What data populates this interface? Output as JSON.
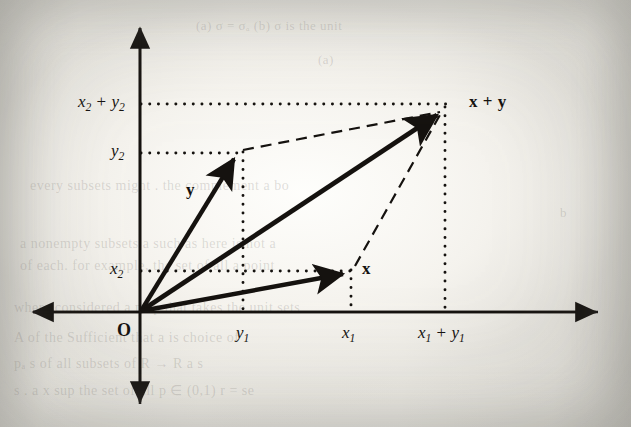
{
  "figure": {
    "kind": "vector-addition-parallelogram-diagram",
    "origin_label": "O",
    "axis_labels": {
      "y_top_value": "x₂ + y₂",
      "y_mid_value": "y₂",
      "y_low_value": "x₂",
      "x_first_value": "y₁",
      "x_second_value": "x₁",
      "x_sum_value": "x₁ + y₁"
    },
    "vector_labels": {
      "vec_y": "y",
      "vec_x": "x",
      "vec_sum": "x + y"
    },
    "parts": {
      "x2_plus_y2": {
        "base": "x",
        "sub": "2",
        "op": " + ",
        "base2": "y",
        "sub2": "2"
      },
      "y2": {
        "base": "y",
        "sub": "2"
      },
      "x2": {
        "base": "x",
        "sub": "2"
      },
      "y1": {
        "base": "y",
        "sub": "1"
      },
      "x1": {
        "base": "x",
        "sub": "1"
      },
      "x1_plus_y1": {
        "base": "x",
        "sub": "1",
        "op": " + ",
        "base2": "y",
        "sub2": "1"
      },
      "sum_vec": {
        "first": "x",
        "op": " + ",
        "second": "y"
      }
    },
    "colors": {
      "ink": "#15120f",
      "paper": "#efedE7",
      "bleed_text": "rgba(92,88,82,0.20)"
    }
  },
  "chart_data": {
    "type": "scatter",
    "title": "",
    "xlabel": "",
    "ylabel": "",
    "grid": false,
    "legend": "none",
    "axis_style": "double-headed arrows, no tick marks, labelled component values only",
    "points": [
      {
        "name": "O",
        "label": "O",
        "px": [
          140,
          312
        ],
        "role": "origin"
      },
      {
        "name": "y-tip",
        "label": "y",
        "px": [
          238,
          152
        ],
        "components": [
          "y₁",
          "y₂"
        ]
      },
      {
        "name": "x-tip",
        "label": "x",
        "px": [
          350,
          270
        ],
        "components": [
          "x₁",
          "x₂"
        ]
      },
      {
        "name": "sum-tip",
        "label": "x + y",
        "px": [
          443,
          108
        ],
        "components": [
          "x₁ + y₁",
          "x₂ + y₂"
        ]
      }
    ],
    "vectors": [
      {
        "name": "y",
        "from": "O",
        "to": "y-tip",
        "style": "solid-arrow"
      },
      {
        "name": "x",
        "from": "O",
        "to": "x-tip",
        "style": "solid-arrow"
      },
      {
        "name": "x + y",
        "from": "O",
        "to": "sum-tip",
        "style": "solid-arrow"
      }
    ],
    "dashed_edges": [
      {
        "from": "y-tip",
        "to": "sum-tip"
      },
      {
        "from": "x-tip",
        "to": "sum-tip"
      }
    ],
    "dotted_guides": [
      {
        "orientation": "horizontal",
        "value_label": "x₂ + y₂",
        "y_px": 104,
        "from_x": 141,
        "to_x": 446
      },
      {
        "orientation": "horizontal",
        "value_label": "y₂",
        "y_px": 153,
        "from_x": 141,
        "to_x": 243
      },
      {
        "orientation": "horizontal",
        "value_label": "x₂",
        "y_px": 271,
        "from_x": 141,
        "to_x": 352
      },
      {
        "orientation": "vertical",
        "value_label": "y₁",
        "x_px": 243,
        "from_y": 153,
        "to_y": 311
      },
      {
        "orientation": "vertical",
        "value_label": "x₁",
        "x_px": 351,
        "from_y": 271,
        "to_y": 311
      },
      {
        "orientation": "vertical",
        "value_label": "x₁ + y₁",
        "x_px": 445,
        "from_y": 106,
        "to_y": 311
      }
    ],
    "axes": {
      "x_axis": {
        "y_px": 312,
        "from_x": 30,
        "to_x": 600,
        "arrows": "both"
      },
      "y_axis": {
        "x_px": 140,
        "from_y": 25,
        "to_y": 406,
        "arrows": "both"
      }
    }
  },
  "bleed_through": {
    "lines": [
      {
        "text": "(a) σ = σₐ        (b) σ is the unit",
        "x": 196,
        "y": 18,
        "size": 13
      },
      {
        "text": "(a)",
        "x": 318,
        "y": 52,
        "size": 13
      },
      {
        "text": "every  subsets  might  .  the  complement  a  bo",
        "x": 30,
        "y": 178,
        "size": 14
      },
      {
        "text": "b",
        "x": 560,
        "y": 205,
        "size": 13
      },
      {
        "text": "a  nonempty  subsets  a  such as  here  is  not  a",
        "x": 20,
        "y": 236,
        "size": 14
      },
      {
        "text": "of  each.  for  example,  the  set  of  all  a  point",
        "x": 20,
        "y": 258,
        "size": 14
      },
      {
        "text": "where  considered  a  map  that  takes  the  unit  sets",
        "x": 14,
        "y": 300,
        "size": 14
      },
      {
        "text": "A  of  the  Sufficient  that  a  is  choice  of",
        "x": 14,
        "y": 330,
        "size": 14
      },
      {
        "text": "pₐ  s  of all  subsets  of  R → R   a  s",
        "x": 14,
        "y": 356,
        "size": 14
      },
      {
        "text": "s  .  a  x  sup  the  set  of  all  p ∈ (0,1)  r  =  se",
        "x": 14,
        "y": 382,
        "size": 14
      }
    ]
  }
}
